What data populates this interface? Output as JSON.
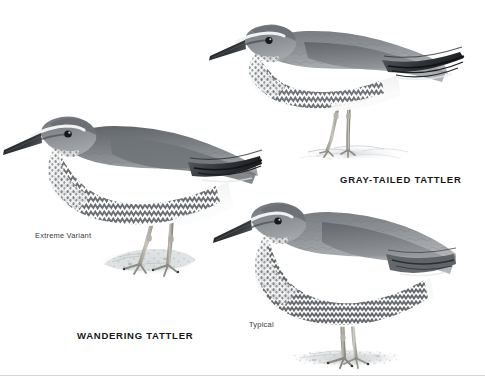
{
  "plate": {
    "width": 485,
    "height": 376,
    "background_color": "#ffffff",
    "medium": "grayscale field-guide illustration",
    "bottom_edge_color": "#d8d8d8"
  },
  "labels": {
    "gray_tailed_tattler": "GRAY-TAILED TATTLER",
    "wandering_tattler": "WANDERING TATTLER",
    "extreme_variant": "Extreme Variant",
    "typical": "Typical"
  },
  "colors": {
    "ink_dark": "#2e3133",
    "ink_darkest": "#16181a",
    "upperpart_gray": "#8d9195",
    "upperpart_gray_light": "#a9adb0",
    "underpart_white": "#f6f7f7",
    "bar_gray": "#6e7276",
    "leg_pale": "#b9b7ad",
    "leg_shadow": "#8d8b83",
    "ground_gray": "#cfd2d3",
    "ripple_gray": "#c3c8cb",
    "label_text": "#171717",
    "variant_text": "#3b3b3b"
  },
  "birds": [
    {
      "id": "gray-tailed-tattler",
      "label": "GRAY-TAILED TATTLER",
      "pose": "crouched foraging, head lowered to the left",
      "habitat": "standing in shallow water with ripples",
      "bbox": [
        212,
        12,
        250,
        150
      ],
      "features": [
        "long straight dark bill",
        "white supercilium",
        "dark eye",
        "plain gray upperparts",
        "finely barred breast and flanks",
        "pale yellow-gray legs"
      ]
    },
    {
      "id": "wandering-tattler-extreme-variant",
      "label": "WANDERING TATTLER",
      "sublabel": "Extreme Variant",
      "pose": "upright standing, facing left",
      "habitat": "standing on a textured rock",
      "bbox": [
        12,
        112,
        248,
        178
      ],
      "features": [
        "long straight dark bill",
        "white supercilium",
        "dark gray upperparts",
        "heavily barred underparts to the undertail",
        "pale legs"
      ]
    },
    {
      "id": "wandering-tattler-typical",
      "label": "WANDERING TATTLER",
      "sublabel": "Typical",
      "pose": "plump, standing, facing left",
      "habitat": "standing on sand and pebbles",
      "bbox": [
        218,
        198,
        228,
        172
      ],
      "features": [
        "long straight dark bill",
        "short white supercilium",
        "uniform gray upperparts",
        "dense chevron barring over entire underparts",
        "short pale legs"
      ]
    }
  ],
  "label_positions": {
    "gray_tailed_tattler": {
      "left": 340,
      "top": 174
    },
    "wandering_tattler": {
      "left": 77,
      "top": 330
    },
    "extreme_variant": {
      "left": 35,
      "top": 231
    },
    "typical": {
      "left": 249,
      "top": 320
    }
  }
}
